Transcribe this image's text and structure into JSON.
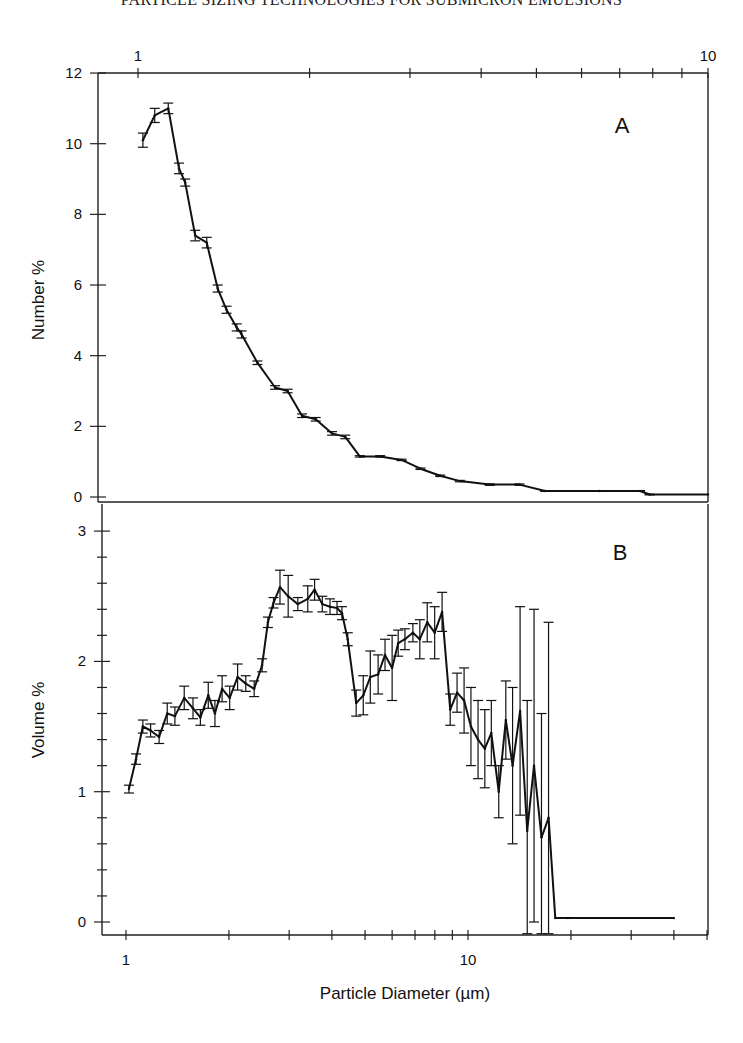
{
  "page": {
    "running_head": "PARTICLE SIZING TECHNOLOGIES FOR SUBMICRON EMULSIONS"
  },
  "chart_data": [
    {
      "type": "line",
      "panel_label": "A",
      "title": "",
      "xlabel": "",
      "ylabel": "Number %",
      "x_scale": "log",
      "x_axis_position": "top",
      "xlim": [
        0.85,
        10
      ],
      "ylim": [
        -0.15,
        12
      ],
      "x_ticks": [
        1,
        2,
        3,
        4,
        5,
        6,
        7,
        8,
        9,
        10
      ],
      "x_tick_labels": [
        "1",
        "10"
      ],
      "y_ticks": [
        0,
        2,
        4,
        6,
        8,
        10,
        12
      ],
      "y_tick_labels": [
        "0",
        "2",
        "4",
        "6",
        "8",
        "10",
        "12"
      ],
      "grid": false,
      "series": [
        {
          "name": "Number %",
          "x": [
            1.02,
            1.07,
            1.13,
            1.18,
            1.21,
            1.26,
            1.32,
            1.38,
            1.43,
            1.49,
            1.52,
            1.62,
            1.74,
            1.83,
            1.94,
            2.05,
            2.19,
            2.31,
            2.45,
            2.66,
            2.9,
            3.13,
            3.39,
            3.67,
            4.14,
            4.67,
            5.18,
            6.45,
            7.6,
            7.9,
            10
          ],
          "values": [
            10.1,
            10.8,
            11.0,
            9.3,
            8.9,
            7.4,
            7.2,
            5.9,
            5.3,
            4.8,
            4.6,
            3.8,
            3.1,
            3.0,
            2.3,
            2.2,
            1.8,
            1.7,
            1.15,
            1.15,
            1.05,
            0.8,
            0.6,
            0.45,
            0.35,
            0.35,
            0.17,
            0.17,
            0.17,
            0.07,
            0.07
          ],
          "error": [
            0.2,
            0.2,
            0.15,
            0.15,
            0.1,
            0.15,
            0.15,
            0.1,
            0.1,
            0.1,
            0.1,
            0.05,
            0.05,
            0.05,
            0.05,
            0.05,
            0.05,
            0.05,
            0.02,
            0.02,
            0.02,
            0.02,
            0.02,
            0.02,
            0.02,
            0.02,
            0.01,
            0.01,
            0.01,
            0.01,
            0.0
          ]
        }
      ]
    },
    {
      "type": "line",
      "panel_label": "B",
      "title": "",
      "xlabel": "Particle Diameter (µm)",
      "ylabel": "Volume %",
      "x_scale": "log",
      "x_axis_position": "bottom",
      "xlim": [
        0.85,
        50
      ],
      "ylim": [
        -0.1,
        3.2
      ],
      "x_ticks": [
        1,
        2,
        3,
        4,
        5,
        6,
        7,
        8,
        9,
        10,
        20,
        30,
        40,
        50
      ],
      "x_tick_labels": [
        "1",
        "10"
      ],
      "y_ticks": [
        0,
        1,
        2,
        3
      ],
      "y_tick_labels": [
        "0",
        "1",
        "2",
        "3"
      ],
      "y_minor_step": 0.2,
      "grid": false,
      "series": [
        {
          "name": "Volume %",
          "x": [
            1.02,
            1.07,
            1.12,
            1.18,
            1.25,
            1.32,
            1.39,
            1.48,
            1.57,
            1.65,
            1.74,
            1.82,
            1.91,
            2.01,
            2.12,
            2.24,
            2.37,
            2.5,
            2.6,
            2.7,
            2.82,
            2.98,
            3.18,
            3.4,
            3.56,
            3.75,
            3.95,
            4.14,
            4.28,
            4.45,
            4.71,
            4.94,
            5.18,
            5.46,
            5.72,
            6.0,
            6.25,
            6.54,
            6.9,
            7.23,
            7.6,
            7.99,
            8.4,
            8.87,
            9.29,
            9.74,
            10.2,
            10.7,
            11.2,
            11.7,
            12.3,
            12.9,
            13.5,
            14.2,
            14.9,
            15.6,
            16.4,
            17.2,
            18.0,
            19.6,
            40
          ],
          "values": [
            1.02,
            1.25,
            1.5,
            1.47,
            1.42,
            1.6,
            1.58,
            1.72,
            1.64,
            1.57,
            1.74,
            1.6,
            1.79,
            1.72,
            1.88,
            1.83,
            1.79,
            1.97,
            2.3,
            2.45,
            2.57,
            2.5,
            2.44,
            2.48,
            2.55,
            2.44,
            2.42,
            2.41,
            2.37,
            2.17,
            1.68,
            1.74,
            1.88,
            1.9,
            2.05,
            1.95,
            2.14,
            2.17,
            2.22,
            2.17,
            2.3,
            2.22,
            2.38,
            1.63,
            1.76,
            1.7,
            1.5,
            1.4,
            1.33,
            1.45,
            1.0,
            1.55,
            1.2,
            1.62,
            0.7,
            1.2,
            0.65,
            0.8,
            0.03,
            0.03,
            0.03
          ],
          "error": [
            0.03,
            0.04,
            0.05,
            0.05,
            0.05,
            0.08,
            0.07,
            0.09,
            0.08,
            0.06,
            0.1,
            0.1,
            0.1,
            0.09,
            0.1,
            0.06,
            0.06,
            0.05,
            0.04,
            0.04,
            0.13,
            0.16,
            0.05,
            0.1,
            0.08,
            0.06,
            0.06,
            0.05,
            0.05,
            0.05,
            0.1,
            0.15,
            0.2,
            0.15,
            0.12,
            0.25,
            0.1,
            0.08,
            0.07,
            0.15,
            0.15,
            0.2,
            0.15,
            0.12,
            0.15,
            0.25,
            0.3,
            0.3,
            0.3,
            0.25,
            0.2,
            0.3,
            0.6,
            0.8,
            1.0,
            1.2,
            0.95,
            1.5,
            0.0,
            0.0,
            0.0
          ]
        }
      ]
    }
  ]
}
